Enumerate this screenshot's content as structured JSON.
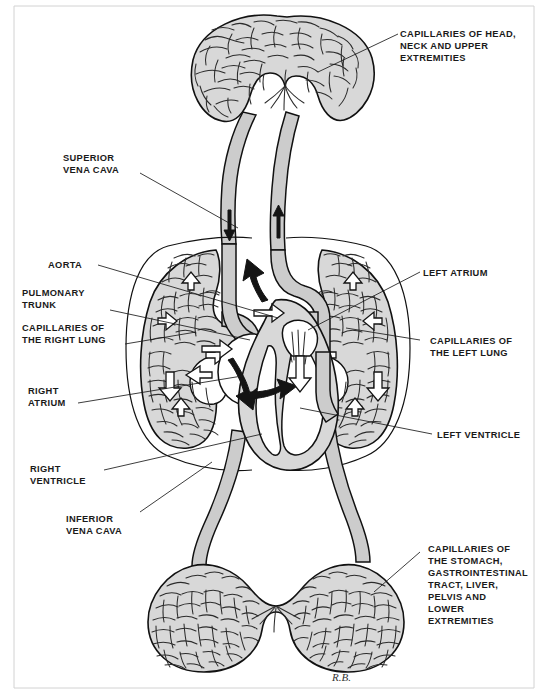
{
  "figure": {
    "signature": "R.B.",
    "background_color": "#ffffff",
    "ink_color": "#111111",
    "tissue_fill": "#d8d8d8",
    "vessel_fill": "#cccccc"
  },
  "labels": {
    "head_capillaries": {
      "lines": [
        "CAPILLARIES OF HEAD,",
        "NECK AND UPPER",
        "EXTREMITIES"
      ],
      "side": "right"
    },
    "superior_vena_cava": {
      "lines": [
        "SUPERIOR",
        "VENA CAVA"
      ],
      "side": "left"
    },
    "aorta": {
      "lines": [
        "AORTA"
      ],
      "side": "left"
    },
    "pulmonary_trunk": {
      "lines": [
        "PULMONARY",
        "TRUNK"
      ],
      "side": "left"
    },
    "right_lung_capillaries": {
      "lines": [
        "CAPILLARIES OF",
        "THE RIGHT LUNG"
      ],
      "side": "left"
    },
    "right_atrium": {
      "lines": [
        "RIGHT",
        "ATRIUM"
      ],
      "side": "left"
    },
    "right_ventricle": {
      "lines": [
        "RIGHT",
        "VENTRICLE"
      ],
      "side": "left"
    },
    "inferior_vena_cava": {
      "lines": [
        "INFERIOR",
        "VENA CAVA"
      ],
      "side": "left"
    },
    "left_atrium": {
      "lines": [
        "LEFT ATRIUM"
      ],
      "side": "right"
    },
    "left_lung_capillaries": {
      "lines": [
        "CAPILLARIES OF",
        "THE LEFT LUNG"
      ],
      "side": "right"
    },
    "left_ventricle": {
      "lines": [
        "LEFT VENTRICLE"
      ],
      "side": "right"
    },
    "lower_capillaries": {
      "lines": [
        "CAPILLARIES OF",
        "THE STOMACH,",
        "GASTROINTESTINAL",
        "TRACT, LIVER,",
        "PELVIS AND",
        "LOWER",
        "EXTREMITIES"
      ],
      "side": "right"
    }
  },
  "flow_arrows": {
    "dark_meaning": "deoxygenated blood flow",
    "open_meaning": "oxygenated blood flow"
  }
}
